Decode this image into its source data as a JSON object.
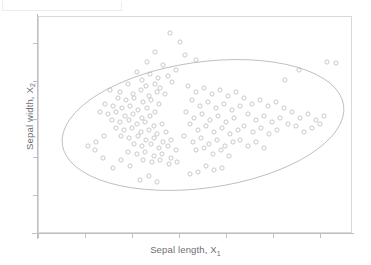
{
  "figure": {
    "axis_label_x": "Sepal length, X",
    "axis_label_x_sub": "1",
    "axis_label_y": "Sepal width, X",
    "axis_label_y_sub": "2"
  },
  "chart_data": {
    "type": "scatter",
    "title": "",
    "xlabel": "Sepal length, X1",
    "ylabel": "Sepal width, X2",
    "xlim": [
      0,
      1
    ],
    "ylim": [
      0,
      1
    ],
    "grid": false,
    "legend": null,
    "xtick_labels": [],
    "ytick_labels": [],
    "marker": {
      "shape": "open-circle",
      "color": "#c3c3c9",
      "size_px": 4.2,
      "filled": false
    },
    "annotations": [
      {
        "kind": "ellipse",
        "label": "confidence-ellipse",
        "center_px": [
          203,
          125
        ],
        "radius_x_px": 142,
        "radius_y_px": 63,
        "rotation_deg": -8,
        "stroke": "#b2b2ba"
      }
    ],
    "xticks_px": [
      38,
      85,
      132,
      179,
      226,
      273,
      320
    ],
    "yticks_px": [
      43,
      81,
      119,
      157,
      195,
      233
    ],
    "points_px": [
      [
        180,
        42
      ],
      [
        155,
        52
      ],
      [
        170,
        33
      ],
      [
        185,
        55
      ],
      [
        147,
        62
      ],
      [
        163,
        65
      ],
      [
        176,
        70
      ],
      [
        196,
        60
      ],
      [
        137,
        72
      ],
      [
        150,
        74
      ],
      [
        158,
        78
      ],
      [
        168,
        76
      ],
      [
        142,
        80
      ],
      [
        128,
        84
      ],
      [
        146,
        86
      ],
      [
        155,
        84
      ],
      [
        160,
        88
      ],
      [
        172,
        82
      ],
      [
        110,
        90
      ],
      [
        120,
        92
      ],
      [
        133,
        94
      ],
      [
        141,
        90
      ],
      [
        149,
        96
      ],
      [
        157,
        92
      ],
      [
        165,
        94
      ],
      [
        118,
        98
      ],
      [
        126,
        100
      ],
      [
        134,
        98
      ],
      [
        143,
        102
      ],
      [
        151,
        100
      ],
      [
        159,
        104
      ],
      [
        105,
        104
      ],
      [
        113,
        106
      ],
      [
        122,
        108
      ],
      [
        130,
        106
      ],
      [
        138,
        110
      ],
      [
        147,
        108
      ],
      [
        155,
        112
      ],
      [
        100,
        112
      ],
      [
        108,
        114
      ],
      [
        116,
        112
      ],
      [
        125,
        116
      ],
      [
        133,
        114
      ],
      [
        142,
        118
      ],
      [
        150,
        116
      ],
      [
        112,
        120
      ],
      [
        120,
        122
      ],
      [
        129,
        120
      ],
      [
        137,
        124
      ],
      [
        145,
        122
      ],
      [
        154,
        126
      ],
      [
        162,
        124
      ],
      [
        116,
        128
      ],
      [
        124,
        130
      ],
      [
        132,
        128
      ],
      [
        141,
        132
      ],
      [
        149,
        130
      ],
      [
        157,
        134
      ],
      [
        166,
        132
      ],
      [
        121,
        136
      ],
      [
        129,
        138
      ],
      [
        138,
        136
      ],
      [
        146,
        140
      ],
      [
        154,
        138
      ],
      [
        163,
        142
      ],
      [
        171,
        140
      ],
      [
        134,
        144
      ],
      [
        142,
        146
      ],
      [
        151,
        144
      ],
      [
        159,
        148
      ],
      [
        168,
        146
      ],
      [
        176,
        150
      ],
      [
        128,
        152
      ],
      [
        137,
        154
      ],
      [
        145,
        152
      ],
      [
        154,
        156
      ],
      [
        162,
        154
      ],
      [
        171,
        158
      ],
      [
        143,
        160
      ],
      [
        152,
        162
      ],
      [
        160,
        160
      ],
      [
        169,
        164
      ],
      [
        177,
        162
      ],
      [
        113,
        168
      ],
      [
        121,
        160
      ],
      [
        130,
        166
      ],
      [
        95,
        150
      ],
      [
        103,
        158
      ],
      [
        188,
        86
      ],
      [
        196,
        92
      ],
      [
        204,
        88
      ],
      [
        212,
        94
      ],
      [
        220,
        90
      ],
      [
        228,
        96
      ],
      [
        236,
        92
      ],
      [
        192,
        100
      ],
      [
        200,
        106
      ],
      [
        208,
        102
      ],
      [
        216,
        108
      ],
      [
        224,
        104
      ],
      [
        232,
        110
      ],
      [
        240,
        106
      ],
      [
        186,
        112
      ],
      [
        194,
        118
      ],
      [
        202,
        114
      ],
      [
        210,
        120
      ],
      [
        218,
        116
      ],
      [
        226,
        122
      ],
      [
        234,
        118
      ],
      [
        190,
        124
      ],
      [
        198,
        130
      ],
      [
        206,
        126
      ],
      [
        214,
        132
      ],
      [
        222,
        128
      ],
      [
        230,
        134
      ],
      [
        238,
        130
      ],
      [
        184,
        136
      ],
      [
        193,
        142
      ],
      [
        201,
        138
      ],
      [
        209,
        144
      ],
      [
        217,
        140
      ],
      [
        225,
        146
      ],
      [
        233,
        142
      ],
      [
        196,
        150
      ],
      [
        204,
        148
      ],
      [
        213,
        154
      ],
      [
        221,
        150
      ],
      [
        229,
        156
      ],
      [
        244,
        98
      ],
      [
        252,
        104
      ],
      [
        260,
        100
      ],
      [
        268,
        106
      ],
      [
        276,
        102
      ],
      [
        284,
        108
      ],
      [
        248,
        114
      ],
      [
        256,
        120
      ],
      [
        264,
        116
      ],
      [
        272,
        122
      ],
      [
        280,
        118
      ],
      [
        288,
        124
      ],
      [
        244,
        126
      ],
      [
        253,
        132
      ],
      [
        261,
        128
      ],
      [
        269,
        134
      ],
      [
        277,
        130
      ],
      [
        292,
        112
      ],
      [
        300,
        118
      ],
      [
        308,
        114
      ],
      [
        316,
        120
      ],
      [
        324,
        116
      ],
      [
        296,
        126
      ],
      [
        304,
        132
      ],
      [
        312,
        128
      ],
      [
        320,
        124
      ],
      [
        285,
        80
      ],
      [
        299,
        70
      ],
      [
        327,
        62
      ],
      [
        336,
        63
      ],
      [
        206,
        166
      ],
      [
        214,
        170
      ],
      [
        222,
        168
      ],
      [
        190,
        174
      ],
      [
        198,
        172
      ],
      [
        140,
        180
      ],
      [
        149,
        176
      ],
      [
        157,
        182
      ],
      [
        240,
        140
      ],
      [
        248,
        146
      ],
      [
        256,
        142
      ],
      [
        264,
        148
      ],
      [
        104,
        136
      ],
      [
        96,
        142
      ],
      [
        88,
        146
      ]
    ]
  }
}
